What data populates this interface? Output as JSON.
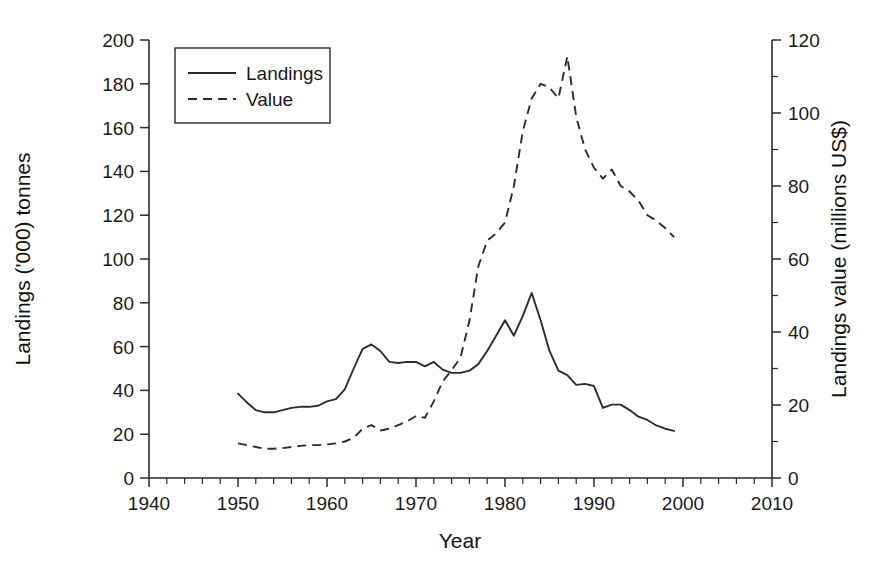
{
  "chart_data": {
    "type": "line",
    "title": "",
    "xlabel": "Year",
    "ylabel": "Landings ('000) tonnes",
    "y2label": "Landings value (millions US$)",
    "xlim": [
      1940,
      2010
    ],
    "ylim": [
      0,
      200
    ],
    "y2lim": [
      0,
      120
    ],
    "xticks": [
      1940,
      1950,
      1960,
      1970,
      1980,
      1990,
      2000,
      2010
    ],
    "xtick_labels": [
      "1940",
      "1950",
      "1960",
      "1970",
      "1980",
      "1990",
      "2000",
      "2010"
    ],
    "x_minor_step": 2,
    "yticks": [
      0,
      20,
      40,
      60,
      80,
      100,
      120,
      140,
      160,
      180,
      200
    ],
    "ytick_labels": [
      "0",
      "20",
      "40",
      "60",
      "80",
      "100",
      "120",
      "140",
      "160",
      "180",
      "200"
    ],
    "y2ticks": [
      0,
      20,
      40,
      60,
      80,
      100,
      120
    ],
    "y2tick_labels": [
      "0",
      "20",
      "40",
      "60",
      "80",
      "100",
      "120"
    ],
    "y2_minor_step": 10,
    "grid": false,
    "legend_position": "top-left",
    "legend_entries": [
      {
        "label": "Landings",
        "style": "solid",
        "axis": "left"
      },
      {
        "label": "Value",
        "style": "dashed",
        "axis": "right"
      }
    ],
    "series": [
      {
        "name": "Landings",
        "axis": "left",
        "style": "solid",
        "units": "'000 tonnes",
        "x": [
          1950,
          1951,
          1952,
          1953,
          1954,
          1955,
          1956,
          1957,
          1958,
          1959,
          1960,
          1961,
          1962,
          1963,
          1964,
          1965,
          1966,
          1967,
          1968,
          1969,
          1970,
          1971,
          1972,
          1973,
          1974,
          1975,
          1976,
          1977,
          1978,
          1979,
          1980,
          1981,
          1982,
          1983,
          1984,
          1985,
          1986,
          1987,
          1988,
          1989,
          1990,
          1991,
          1992,
          1993,
          1994,
          1995,
          1996,
          1997,
          1998,
          1999
        ],
        "values": [
          38.5,
          34.5,
          31.0,
          30.0,
          30.0,
          31.0,
          32.0,
          32.5,
          32.5,
          33.0,
          35.0,
          36.0,
          40.5,
          50.0,
          59.0,
          61.0,
          58.0,
          53.0,
          52.5,
          53.0,
          53.0,
          51.0,
          53.0,
          49.5,
          48.0,
          48.0,
          49.0,
          52.0,
          58.0,
          65.0,
          72.0,
          65.0,
          74.0,
          84.5,
          72.0,
          58.0,
          49.0,
          47.0,
          42.5,
          43.0,
          42.0,
          32.0,
          33.5,
          33.5,
          31.0,
          28.0,
          26.5,
          24.0,
          22.5,
          21.5
        ]
      },
      {
        "name": "Value",
        "axis": "right",
        "style": "dashed",
        "units": "millions US$",
        "x": [
          1950,
          1951,
          1952,
          1953,
          1954,
          1955,
          1956,
          1957,
          1958,
          1959,
          1960,
          1961,
          1962,
          1963,
          1964,
          1965,
          1966,
          1967,
          1968,
          1969,
          1970,
          1971,
          1972,
          1973,
          1974,
          1975,
          1976,
          1977,
          1978,
          1979,
          1980,
          1981,
          1982,
          1983,
          1984,
          1985,
          1986,
          1987,
          1988,
          1989,
          1990,
          1991,
          1992,
          1993,
          1994,
          1995,
          1996,
          1997,
          1998,
          1999
        ],
        "values": [
          9.5,
          9.0,
          8.5,
          8.0,
          8.0,
          8.2,
          8.5,
          8.8,
          9.0,
          9.0,
          9.2,
          9.5,
          10.0,
          11.0,
          13.5,
          14.5,
          13.0,
          13.5,
          14.5,
          15.5,
          17.0,
          16.5,
          21.0,
          26.5,
          29.5,
          33.0,
          43.0,
          58.0,
          65.0,
          67.0,
          70.0,
          80.0,
          95.0,
          104.0,
          108.0,
          107.0,
          104.0,
          115.5,
          99.0,
          90.0,
          85.0,
          82.0,
          84.5,
          80.0,
          78.5,
          76.0,
          72.0,
          70.5,
          68.5,
          66.0
        ]
      }
    ]
  },
  "axes": {
    "x_title": "Year",
    "y_left_title": "Landings ('000) tonnes",
    "y_right_title": "Landings value (millions US$)"
  },
  "legend": {
    "items": [
      {
        "label": "Landings"
      },
      {
        "label": "Value"
      }
    ]
  }
}
